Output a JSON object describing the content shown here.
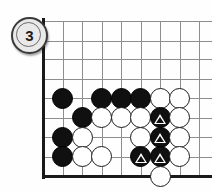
{
  "diagram": {
    "number_label": "3",
    "board": {
      "grid": {
        "x_lines": [
          43,
          62.5,
          82,
          101.5,
          121,
          140.5,
          160,
          179.5,
          199
        ],
        "y_lines": [
          21,
          40.5,
          59,
          78.5,
          98,
          117.5,
          137,
          156.5,
          176
        ],
        "left_edge_x": 43,
        "bottom_edge_y": 176,
        "stone_diameter": 21,
        "line_color": "#8d8d8d",
        "edge_color": "#1a1a1a"
      },
      "stones": [
        {
          "color": "black",
          "x": 62.5,
          "y": 98,
          "mark": null,
          "name": "stone-black-a"
        },
        {
          "color": "black",
          "x": 101.5,
          "y": 98,
          "mark": null,
          "name": "stone-black-b"
        },
        {
          "color": "black",
          "x": 121,
          "y": 98,
          "mark": null,
          "name": "stone-black-c"
        },
        {
          "color": "black",
          "x": 140.5,
          "y": 98,
          "mark": null,
          "name": "stone-black-d"
        },
        {
          "color": "white",
          "x": 160,
          "y": 98,
          "mark": null,
          "name": "stone-white-a"
        },
        {
          "color": "white",
          "x": 179.5,
          "y": 98,
          "mark": null,
          "name": "stone-white-b"
        },
        {
          "color": "black",
          "x": 82,
          "y": 117.5,
          "mark": null,
          "name": "stone-black-e"
        },
        {
          "color": "white",
          "x": 101.5,
          "y": 117.5,
          "mark": null,
          "name": "stone-white-c"
        },
        {
          "color": "white",
          "x": 121,
          "y": 117.5,
          "mark": null,
          "name": "stone-white-d"
        },
        {
          "color": "white",
          "x": 140.5,
          "y": 117.5,
          "mark": null,
          "name": "stone-white-e"
        },
        {
          "color": "black",
          "x": 160,
          "y": 117.5,
          "mark": "triangle",
          "name": "stone-black-marked-1"
        },
        {
          "color": "white",
          "x": 179.5,
          "y": 117.5,
          "mark": null,
          "name": "stone-white-f"
        },
        {
          "color": "black",
          "x": 62.5,
          "y": 137,
          "mark": null,
          "name": "stone-black-f"
        },
        {
          "color": "white",
          "x": 82,
          "y": 137,
          "mark": null,
          "name": "stone-white-g"
        },
        {
          "color": "white",
          "x": 140.5,
          "y": 137,
          "mark": null,
          "name": "stone-white-h"
        },
        {
          "color": "black",
          "x": 160,
          "y": 137,
          "mark": "triangle",
          "name": "stone-black-marked-2"
        },
        {
          "color": "white",
          "x": 179.5,
          "y": 137,
          "mark": null,
          "name": "stone-white-i"
        },
        {
          "color": "black",
          "x": 62.5,
          "y": 156.5,
          "mark": null,
          "name": "stone-black-g"
        },
        {
          "color": "white",
          "x": 82,
          "y": 156.5,
          "mark": null,
          "name": "stone-white-j"
        },
        {
          "color": "white",
          "x": 101.5,
          "y": 156.5,
          "mark": null,
          "name": "stone-white-k"
        },
        {
          "color": "black",
          "x": 140.5,
          "y": 156.5,
          "mark": "triangle",
          "name": "stone-black-marked-3"
        },
        {
          "color": "black",
          "x": 160,
          "y": 156.5,
          "mark": "triangle",
          "name": "stone-black-marked-4"
        },
        {
          "color": "white",
          "x": 179.5,
          "y": 156.5,
          "mark": null,
          "name": "stone-white-l"
        },
        {
          "color": "white",
          "x": 160,
          "y": 176,
          "mark": null,
          "name": "stone-white-m"
        }
      ]
    }
  }
}
